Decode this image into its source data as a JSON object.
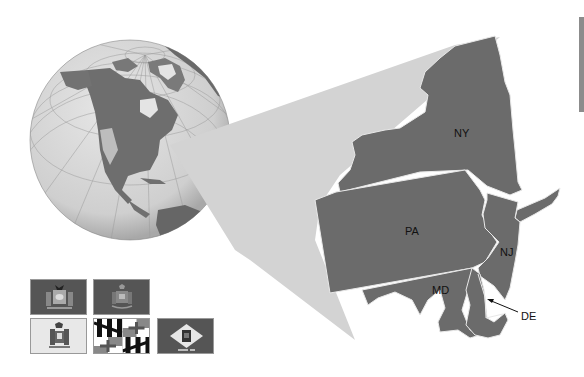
{
  "map": {
    "states": [
      {
        "abbr": "NY",
        "label": "NY"
      },
      {
        "abbr": "PA",
        "label": "PA"
      },
      {
        "abbr": "NJ",
        "label": "NJ"
      },
      {
        "abbr": "MD",
        "label": "MD"
      },
      {
        "abbr": "DE",
        "label": "DE"
      }
    ],
    "colors": {
      "state_fill": "#6b6b6b",
      "border": "#e6e6e6",
      "zoom_wedge": "#d3d3d3",
      "globe_ocean": "#d9d9d9",
      "globe_land": "#6e6e6e"
    }
  },
  "flags": [
    {
      "state": "NY",
      "bg": "#555555"
    },
    {
      "state": "PA",
      "bg": "#555555"
    },
    {
      "state": "NJ",
      "bg": "#e8e8e8"
    },
    {
      "state": "MD",
      "bg": "#ffffff"
    },
    {
      "state": "DE",
      "bg": "#555555"
    }
  ]
}
